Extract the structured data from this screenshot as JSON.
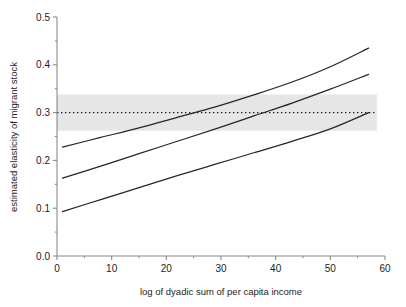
{
  "chart_data": {
    "type": "line",
    "title": "",
    "xlabel": "log of dyadic sum of per capita income",
    "ylabel": "estimated elasticity of migrant stock",
    "xlim": [
      0,
      60
    ],
    "ylim": [
      0.0,
      0.5
    ],
    "grid": false,
    "legend": "none",
    "x_ticks": [
      "0",
      "10",
      "20",
      "30",
      "40",
      "50",
      "60"
    ],
    "x_tick_values": [
      0,
      10,
      20,
      30,
      40,
      50,
      60
    ],
    "x_minor_tick_values": [
      5,
      15,
      25,
      35,
      45,
      55
    ],
    "y_ticks": [
      "0.0",
      "0.1",
      "0.2",
      "0.3",
      "0.4",
      "0.5"
    ],
    "y_tick_values": [
      0.0,
      0.1,
      0.2,
      0.3,
      0.4,
      0.5
    ],
    "y_minor_tick_values": [
      0.05,
      0.15,
      0.25,
      0.35,
      0.45
    ],
    "x_domain_data": [
      1,
      57
    ],
    "series": [
      {
        "name": "upper confidence bound",
        "style": "solid",
        "color": "#262626",
        "x": [
          1,
          8,
          15,
          22,
          29,
          36,
          43,
          50,
          57
        ],
        "values": [
          0.228,
          0.248,
          0.268,
          0.29,
          0.312,
          0.337,
          0.364,
          0.396,
          0.435
        ]
      },
      {
        "name": "point estimate",
        "style": "solid",
        "color": "#262626",
        "x": [
          1,
          8,
          15,
          22,
          29,
          36,
          43,
          50,
          57
        ],
        "values": [
          0.163,
          0.188,
          0.214,
          0.24,
          0.266,
          0.293,
          0.32,
          0.349,
          0.38
        ]
      },
      {
        "name": "lower confidence bound",
        "style": "solid",
        "color": "#262626",
        "x": [
          1,
          8,
          15,
          22,
          29,
          36,
          43,
          50,
          57
        ],
        "values": [
          0.093,
          0.118,
          0.143,
          0.168,
          0.192,
          0.216,
          0.24,
          0.266,
          0.3
        ]
      }
    ],
    "reference_line": {
      "name": "overall estimated elasticity",
      "style": "dotted",
      "color": "#1c1c1c",
      "y": 0.3,
      "x_start": 0,
      "x_end": 58.5
    },
    "reference_band": {
      "name": "confidence band of overall estimate",
      "color": "#e6e6e6",
      "y_lower": 0.262,
      "y_upper": 0.338,
      "x_start": 0,
      "x_end": 58.5
    }
  },
  "axes": {
    "axis_color": "#8a8a8a",
    "spine_left": true,
    "spine_bottom": true
  }
}
